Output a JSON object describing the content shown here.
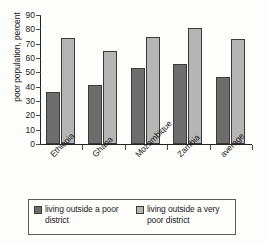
{
  "chart_data": {
    "type": "bar",
    "title": "",
    "xlabel": "",
    "ylabel": "poor population, percent",
    "ylim": [
      0,
      90
    ],
    "ytick_step": 10,
    "yticks": [
      90,
      80,
      70,
      60,
      50,
      40,
      30,
      20,
      10,
      0
    ],
    "grid": false,
    "legend_position": "bottom",
    "categories": [
      "Ethiopia",
      "Ghana",
      "Mozambique",
      "Zambia",
      "average"
    ],
    "series": [
      {
        "name": "living outside a poor district",
        "color": "#6d6d6d",
        "values": [
          36,
          41,
          53,
          56,
          47
        ]
      },
      {
        "name": "living outside a very poor district",
        "color": "#b5b5b5",
        "values": [
          74,
          65,
          75,
          81,
          73
        ]
      }
    ]
  },
  "axis": {
    "y_title": "poor population, percent"
  },
  "legend": {
    "entries": [
      {
        "label": "living outside a poor district",
        "swatch": "dark-swatch"
      },
      {
        "label": "living outside a very poor district",
        "swatch": "light-swatch"
      }
    ]
  }
}
